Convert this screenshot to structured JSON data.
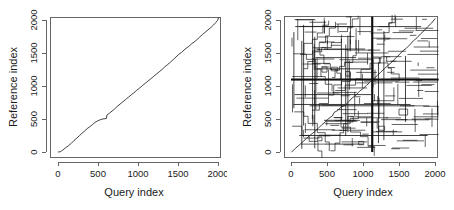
{
  "figure": {
    "title": "",
    "panel_count": 2,
    "background_color": "#ffffff",
    "line_color": "#111111",
    "axis_color": "#555555"
  },
  "panels": [
    {
      "id": "left",
      "name": "alignment-dotplot-clean",
      "xlabel": "Query index",
      "ylabel": "Reference index",
      "xticks": [
        "0",
        "500",
        "1000",
        "1500",
        "2000"
      ],
      "yticks": [
        "0",
        "500",
        "1000",
        "1500",
        "2000"
      ]
    },
    {
      "id": "right",
      "name": "alignment-dotplot-repeats",
      "xlabel": "Query index",
      "ylabel": "Reference index",
      "xticks": [
        "0",
        "500",
        "1000",
        "1500",
        "2000"
      ],
      "yticks": [
        "0",
        "500",
        "1000",
        "1500",
        "2000"
      ]
    }
  ],
  "chart_data": [
    {
      "type": "line",
      "id": "left-panel",
      "title": "",
      "xlabel": "Query index",
      "ylabel": "Reference index",
      "xlim": [
        -60,
        2130
      ],
      "ylim": [
        -60,
        2130
      ],
      "xticks": [
        0,
        500,
        1000,
        1500,
        2000
      ],
      "yticks": [
        0,
        500,
        1000,
        1500,
        2000
      ],
      "grid": false,
      "legend": "none",
      "series": [
        {
          "name": "primary-diagonal-alignment",
          "points": [
            [
              5,
              0
            ],
            [
              30,
              5
            ],
            [
              60,
              30
            ],
            [
              95,
              65
            ],
            [
              130,
              95
            ],
            [
              165,
              130
            ],
            [
              200,
              175
            ],
            [
              235,
              210
            ],
            [
              270,
              250
            ],
            [
              300,
              285
            ],
            [
              330,
              315
            ],
            [
              365,
              355
            ],
            [
              395,
              380
            ],
            [
              430,
              415
            ],
            [
              465,
              450
            ],
            [
              495,
              470
            ],
            [
              530,
              490
            ],
            [
              560,
              500
            ],
            [
              590,
              505
            ],
            [
              605,
              508
            ],
            [
              612,
              560
            ],
            [
              640,
              585
            ],
            [
              675,
              620
            ],
            [
              705,
              650
            ],
            [
              740,
              690
            ],
            [
              775,
              725
            ],
            [
              810,
              760
            ],
            [
              845,
              795
            ],
            [
              880,
              830
            ],
            [
              915,
              865
            ],
            [
              950,
              900
            ],
            [
              985,
              935
            ],
            [
              1020,
              970
            ],
            [
              1055,
              1005
            ],
            [
              1090,
              1040
            ],
            [
              1125,
              1075
            ],
            [
              1160,
              1110
            ],
            [
              1195,
              1145
            ],
            [
              1230,
              1180
            ],
            [
              1265,
              1215
            ],
            [
              1300,
              1250
            ],
            [
              1335,
              1290
            ],
            [
              1370,
              1325
            ],
            [
              1405,
              1360
            ],
            [
              1440,
              1400
            ],
            [
              1475,
              1440
            ],
            [
              1510,
              1480
            ],
            [
              1545,
              1510
            ],
            [
              1575,
              1545
            ],
            [
              1600,
              1570
            ],
            [
              1635,
              1600
            ],
            [
              1670,
              1640
            ],
            [
              1700,
              1665
            ],
            [
              1735,
              1700
            ],
            [
              1770,
              1740
            ],
            [
              1805,
              1780
            ],
            [
              1840,
              1815
            ],
            [
              1875,
              1850
            ],
            [
              1910,
              1885
            ],
            [
              1945,
              1925
            ],
            [
              1975,
              1965
            ],
            [
              1995,
              1995
            ],
            [
              2005,
              2030
            ]
          ]
        }
      ]
    },
    {
      "type": "line",
      "id": "right-panel",
      "title": "",
      "xlabel": "Query index",
      "ylabel": "Reference index",
      "xlim": [
        -60,
        2130
      ],
      "ylim": [
        -60,
        2130
      ],
      "xticks": [
        0,
        500,
        1000,
        1500,
        2000
      ],
      "yticks": [
        0,
        500,
        1000,
        1500,
        2000
      ],
      "grid": false,
      "legend": "none",
      "notable_features": {
        "main_diagonal": "sparse stair-stepped diagonal from (0,0) to (2000,2050)",
        "dominant_vertical_line_x": 1130,
        "dominant_horizontal_line_y": 1100,
        "repeat_block_count": "many short horizontal and vertical segments"
      },
      "series": [
        {
          "name": "main-diagonal",
          "points": [
            [
              10,
              0
            ],
            [
              60,
              55
            ],
            [
              110,
              100
            ],
            [
              160,
              150
            ],
            [
              215,
              205
            ],
            [
              270,
              260
            ],
            [
              320,
              300
            ],
            [
              375,
              355
            ],
            [
              430,
              415
            ],
            [
              480,
              460
            ],
            [
              530,
              515
            ],
            [
              575,
              545
            ],
            [
              600,
              600
            ],
            [
              650,
              630
            ],
            [
              700,
              685
            ],
            [
              745,
              700
            ],
            [
              800,
              760
            ],
            [
              850,
              820
            ],
            [
              900,
              860
            ],
            [
              950,
              920
            ],
            [
              1000,
              960
            ],
            [
              1050,
              1010
            ],
            [
              1100,
              1060
            ],
            [
              1150,
              1110
            ],
            [
              1200,
              1160
            ],
            [
              1250,
              1215
            ],
            [
              1300,
              1265
            ],
            [
              1350,
              1315
            ],
            [
              1400,
              1360
            ],
            [
              1450,
              1420
            ],
            [
              1500,
              1470
            ],
            [
              1550,
              1530
            ],
            [
              1600,
              1570
            ],
            [
              1650,
              1625
            ],
            [
              1700,
              1685
            ],
            [
              1750,
              1730
            ],
            [
              1800,
              1790
            ],
            [
              1850,
              1840
            ],
            [
              1900,
              1900
            ],
            [
              1950,
              1950
            ],
            [
              2000,
              2020
            ]
          ]
        }
      ]
    }
  ]
}
